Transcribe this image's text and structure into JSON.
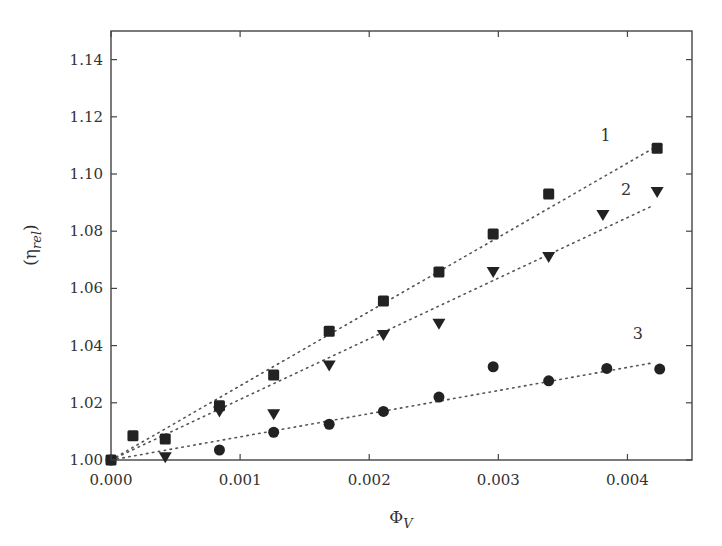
{
  "chart_data": {
    "type": "scatter",
    "title": "",
    "xlabel": "Φ_V",
    "ylabel": "(η_rel)",
    "xlim": [
      0,
      0.0045
    ],
    "ylim": [
      1.0,
      1.15
    ],
    "xticks": [
      0.0,
      0.001,
      0.002,
      0.003,
      0.004
    ],
    "xtick_labels": [
      "0.000",
      "0.001",
      "0.002",
      "0.003",
      "0.004"
    ],
    "yticks": [
      1.0,
      1.02,
      1.04,
      1.06,
      1.08,
      1.1,
      1.12,
      1.14
    ],
    "ytick_labels": [
      "1.00",
      "1.02",
      "1.04",
      "1.06",
      "1.08",
      "1.10",
      "1.12",
      "1.14"
    ],
    "grid": false,
    "legend": "none (inline numeric labels 1, 2, 3)",
    "series": [
      {
        "name": "1",
        "marker": "square",
        "color": "#222222",
        "x": [
          0.0,
          0.00017,
          0.00042,
          0.00084,
          0.00126,
          0.00169,
          0.00211,
          0.00254,
          0.00296,
          0.00339,
          0.00423
        ],
        "y": [
          1.0,
          1.0085,
          1.0073,
          1.019,
          1.0297,
          1.045,
          1.0556,
          1.0657,
          1.079,
          1.093,
          1.109
        ],
        "fit": {
          "style": "dotted",
          "x": [
            0.0,
            0.0042
          ],
          "y": [
            1.0,
            1.109
          ]
        },
        "label_pos": [
          0.00383,
          1.1135
        ]
      },
      {
        "name": "2",
        "marker": "triangle-down",
        "color": "#222222",
        "x": [
          0.00042,
          0.00084,
          0.00126,
          0.00169,
          0.00211,
          0.00254,
          0.00296,
          0.00339,
          0.00381,
          0.00423
        ],
        "y": [
          1.001,
          1.017,
          1.016,
          1.033,
          1.0437,
          1.0476,
          1.0657,
          1.071,
          1.0857,
          1.0937
        ],
        "fit": {
          "style": "dotted",
          "x": [
            0.0,
            0.0042
          ],
          "y": [
            1.0,
            1.089
          ]
        },
        "label_pos": [
          0.00399,
          1.0946
        ]
      },
      {
        "name": "3",
        "marker": "circle",
        "color": "#222222",
        "x": [
          0.0,
          0.00084,
          0.00126,
          0.00169,
          0.00211,
          0.00254,
          0.00296,
          0.00339,
          0.00384,
          0.00425
        ],
        "y": [
          1.0,
          1.0035,
          1.0097,
          1.0125,
          1.017,
          1.022,
          1.0326,
          1.0277,
          1.032,
          1.0318
        ],
        "fit": {
          "style": "dotted",
          "x": [
            0.0,
            0.0042
          ],
          "y": [
            1.0,
            1.034
          ]
        },
        "label_pos": [
          0.00408,
          1.0443
        ]
      }
    ]
  },
  "layout": {
    "plot_left": 111,
    "plot_right": 692,
    "plot_top": 31,
    "plot_bottom": 460
  },
  "labels": {
    "x_axis": "Φ",
    "x_axis_sub": "V",
    "y_axis_open": "(η",
    "y_axis_sub": "rel",
    "y_axis_close": ")"
  }
}
